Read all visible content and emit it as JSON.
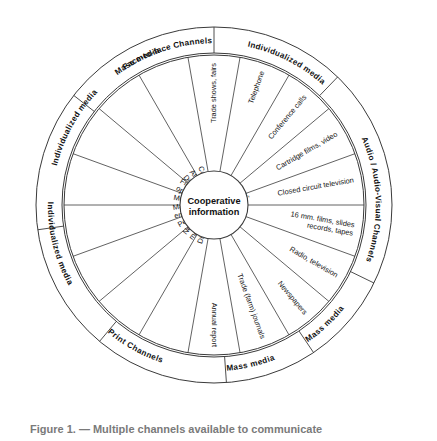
{
  "figure": {
    "type": "radial-wheel-diagram",
    "hub": {
      "line1": "Cooperative",
      "line2": "information"
    },
    "geometry": {
      "center_x": 214,
      "center_y": 205,
      "hub_radius": 34,
      "inner_ring_radius": 150,
      "outer_ring_inner_radius": 152,
      "outer_ring_outer_radius": 178,
      "spoke_count": 16
    },
    "colors": {
      "stroke": "#3a3a3a",
      "background": "#ffffff",
      "text": "#141414",
      "caption": "#7a7a7a"
    },
    "spokes": [
      {
        "index": 0,
        "label": "Trade shows, fairs",
        "lines": [
          "Trade shows, fairs"
        ]
      },
      {
        "index": 1,
        "label": "Telephone",
        "lines": [
          "Telephone"
        ]
      },
      {
        "index": 2,
        "label": "Conference calls",
        "lines": [
          "Conference calls"
        ]
      },
      {
        "index": 3,
        "label": "Cartridge films, video",
        "lines": [
          "Cartridge films, video"
        ]
      },
      {
        "index": 4,
        "label": "Closed circuit television",
        "lines": [
          "Closed circuit television"
        ]
      },
      {
        "index": 5,
        "label": "16 mm. films, slides records, tapes",
        "lines": [
          "16 mm. films, slides",
          "records, tapes"
        ]
      },
      {
        "index": 6,
        "label": "Radio, television",
        "lines": [
          "Radio, television"
        ]
      },
      {
        "index": 7,
        "label": "Newspapers",
        "lines": [
          "Newspapers"
        ]
      },
      {
        "index": 8,
        "label": "Trade (farm) journals",
        "lines": [
          "Trade (farm) journals"
        ]
      },
      {
        "index": 9,
        "label": "Annual report",
        "lines": [
          "Annual report"
        ]
      },
      {
        "index": 10,
        "label": "Direct mail",
        "lines": [
          "Direct mail"
        ]
      },
      {
        "index": 11,
        "label": "Newsletters, member magazines",
        "lines": [
          "Newsletters,",
          "member magazines"
        ]
      },
      {
        "index": 12,
        "label": "Personal letter",
        "lines": [
          "Personal letter"
        ]
      },
      {
        "index": 13,
        "label": "Management, directors, employees, members",
        "lines": [
          "Management, directors,",
          "employees, members"
        ]
      },
      {
        "index": 14,
        "label": "Member committees",
        "lines": [
          "Member committees"
        ]
      },
      {
        "index": 15,
        "label": "Field days, open house, tours",
        "lines": [
          "Field days,",
          "open house, tours"
        ]
      },
      {
        "index": 16,
        "label": "Annual meeting District meeting",
        "lines": [
          "Annual meeting",
          "District meeting"
        ]
      },
      {
        "index": 17,
        "label": "Community meeting",
        "lines": [
          "Community meeting"
        ]
      }
    ],
    "outer_labels": [
      {
        "index": 0,
        "label": "Mass media",
        "kind": "media"
      },
      {
        "index": 1,
        "label": "Individualized media",
        "kind": "media"
      },
      {
        "index": 2,
        "label": "Audio / Audio-Visual Channels",
        "kind": "channel"
      },
      {
        "index": 3,
        "label": "Mass media",
        "kind": "media"
      },
      {
        "index": 4,
        "label": "Mass media",
        "kind": "media"
      },
      {
        "index": 5,
        "label": "Print Channels",
        "kind": "channel"
      },
      {
        "index": 6,
        "label": "Individualized media",
        "kind": "media"
      },
      {
        "index": 7,
        "label": "Individualized media",
        "kind": "media"
      },
      {
        "index": 8,
        "label": "Face-to-face Channels",
        "kind": "channel"
      }
    ],
    "caption": "Figure 1. — Multiple channels available to communicate"
  }
}
